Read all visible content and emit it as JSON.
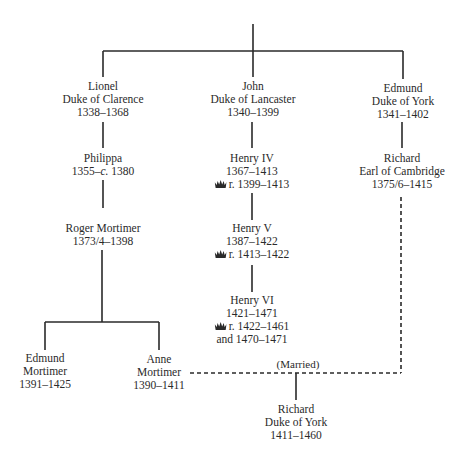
{
  "diagram": {
    "type": "family-tree",
    "line_color": "#2a2a2a",
    "nodes": {
      "lionel": {
        "name": "Lionel",
        "title": "Duke of Clarence",
        "dates": "1338–1368"
      },
      "john": {
        "name": "John",
        "title": "Duke of Lancaster",
        "dates": "1340–1399"
      },
      "edmund_york": {
        "name": "Edmund",
        "title": "Duke of York",
        "dates": "1341–1402"
      },
      "philippa": {
        "name": "Philippa",
        "dates_prefix": "1355–",
        "dates_circa": "c.",
        "dates_suffix": " 1380"
      },
      "henry_iv": {
        "name": "Henry IV",
        "dates": "1367–1413",
        "reign": "r. 1399–1413",
        "reign_icon": "crown-icon"
      },
      "richard_cambridge": {
        "name": "Richard",
        "title": "Earl of Cambridge",
        "dates": "1375/6–1415"
      },
      "roger_mortimer": {
        "name": "Roger Mortimer",
        "dates": "1373/4–1398"
      },
      "henry_v": {
        "name": "Henry V",
        "dates": "1387–1422",
        "reign": "r. 1413–1422",
        "reign_icon": "crown-icon"
      },
      "henry_vi": {
        "name": "Henry VI",
        "dates": "1421–1471",
        "reign": "r. 1422–1461",
        "reign_extra": "and 1470–1471",
        "reign_icon": "crown-icon"
      },
      "edmund_mortimer": {
        "name_line1": "Edmund",
        "name_line2": "Mortimer",
        "dates": "1391–1425"
      },
      "anne_mortimer": {
        "name_line1": "Anne",
        "name_line2": "Mortimer",
        "dates": "1390–1411"
      },
      "richard_york": {
        "name": "Richard",
        "title": "Duke of York",
        "dates": "1411–1460"
      }
    },
    "relations": [
      {
        "from": "root",
        "to": [
          "lionel",
          "john",
          "edmund_york"
        ],
        "style": "solid"
      },
      {
        "from": "lionel",
        "to": [
          "philippa"
        ],
        "style": "solid"
      },
      {
        "from": "philippa",
        "to": [
          "roger_mortimer"
        ],
        "style": "solid"
      },
      {
        "from": "roger_mortimer",
        "to": [
          "edmund_mortimer",
          "anne_mortimer"
        ],
        "style": "solid"
      },
      {
        "from": "john",
        "to": [
          "henry_iv"
        ],
        "style": "solid"
      },
      {
        "from": "henry_iv",
        "to": [
          "henry_v"
        ],
        "style": "solid"
      },
      {
        "from": "henry_v",
        "to": [
          "henry_vi"
        ],
        "style": "solid"
      },
      {
        "from": "edmund_york",
        "to": [
          "richard_cambridge"
        ],
        "style": "solid"
      },
      {
        "from": [
          "anne_mortimer",
          "richard_cambridge"
        ],
        "to": [
          "richard_york"
        ],
        "style": "dashed",
        "label": "(Married)"
      }
    ],
    "married_label": "(Married)"
  }
}
